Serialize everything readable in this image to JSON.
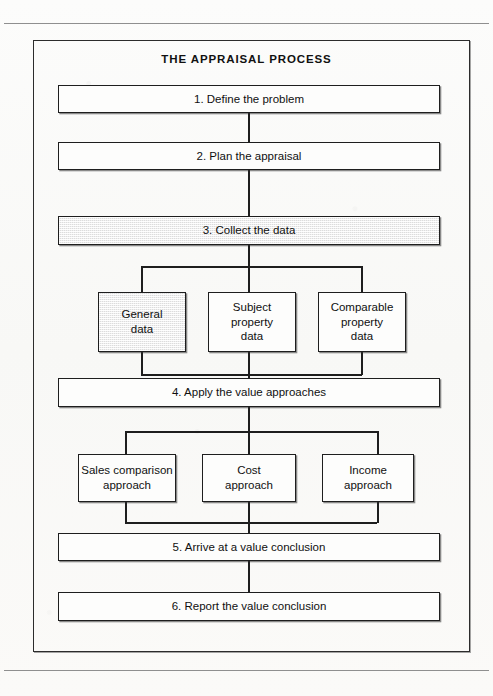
{
  "diagram": {
    "title": "THE APPRAISAL PROCESS",
    "steps": [
      {
        "id": "step-1",
        "label": "1. Define the problem",
        "shaded": false
      },
      {
        "id": "step-2",
        "label": "2.  Plan the appraisal",
        "shaded": false
      },
      {
        "id": "step-3",
        "label": "3.  Collect the data",
        "shaded": true
      },
      {
        "id": "step-4",
        "label": "4.  Apply the value approaches",
        "shaded": false
      },
      {
        "id": "step-5",
        "label": "5.  Arrive at a value conclusion",
        "shaded": false
      },
      {
        "id": "step-6",
        "label": "6.  Report the value conclusion",
        "shaded": false
      }
    ],
    "data_types": [
      {
        "id": "general",
        "line1": "General",
        "line2": "data",
        "line3": "",
        "shaded": true
      },
      {
        "id": "subject",
        "line1": "Subject",
        "line2": "property",
        "line3": "data",
        "shaded": false
      },
      {
        "id": "comparable",
        "line1": "Comparable",
        "line2": "property",
        "line3": "data",
        "shaded": false
      }
    ],
    "approaches": [
      {
        "id": "sales",
        "line1": "Sales comparison",
        "line2": "approach"
      },
      {
        "id": "cost",
        "line1": "Cost",
        "line2": "approach"
      },
      {
        "id": "income",
        "line1": "Income",
        "line2": "approach"
      }
    ],
    "colors": {
      "ink": "#1e1e1e",
      "shade_fill": "#dcdcdc",
      "paper": "#fbfbfa",
      "rule": "#8f8f8f"
    }
  }
}
